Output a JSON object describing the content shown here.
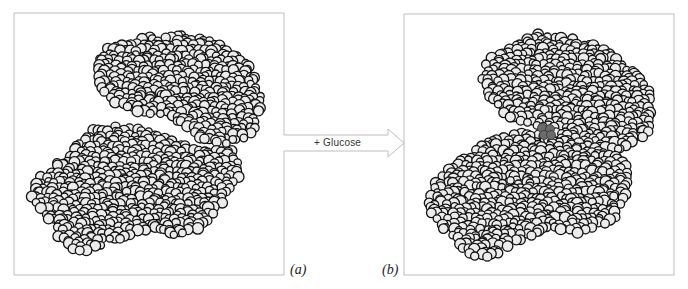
{
  "figure": {
    "arrow_label": "+ Glucose",
    "panels": [
      {
        "id": "a",
        "label": "(a)",
        "frame": {
          "x": 14,
          "y": 13,
          "w": 270,
          "h": 262
        },
        "state": "without glucose (open cleft)",
        "lobes": [
          {
            "name": "upper-lobe",
            "poly": [
              [
                100,
                50
              ],
              [
                140,
                38
              ],
              [
                180,
                34
              ],
              [
                215,
                42
              ],
              [
                240,
                55
              ],
              [
                256,
                75
              ],
              [
                262,
                100
              ],
              [
                258,
                125
              ],
              [
                245,
                140
              ],
              [
                225,
                145
              ],
              [
                200,
                140
              ],
              [
                185,
                128
              ],
              [
                160,
                115
              ],
              [
                130,
                112
              ],
              [
                108,
                100
              ],
              [
                98,
                80
              ]
            ]
          },
          {
            "name": "lower-lobe",
            "poly": [
              [
                30,
                200
              ],
              [
                38,
                178
              ],
              [
                60,
                160
              ],
              [
                95,
                128
              ],
              [
                125,
                125
              ],
              [
                150,
                130
              ],
              [
                170,
                140
              ],
              [
                200,
                150
              ],
              [
                235,
                150
              ],
              [
                240,
                175
              ],
              [
                225,
                200
              ],
              [
                200,
                230
              ],
              [
                175,
                235
              ],
              [
                140,
                230
              ],
              [
                110,
                245
              ],
              [
                75,
                255
              ],
              [
                60,
                240
              ],
              [
                50,
                222
              ]
            ]
          }
        ],
        "ligand": null
      },
      {
        "id": "b",
        "label": "(b)",
        "frame": {
          "x": 404,
          "y": 14,
          "w": 270,
          "h": 261
        },
        "state": "with glucose bound (closed cleft)",
        "lobes": [
          {
            "name": "upper-lobe",
            "poly": [
              [
                485,
                60
              ],
              [
                540,
                33
              ],
              [
                590,
                40
              ],
              [
                635,
                70
              ],
              [
                655,
                100
              ],
              [
                648,
                135
              ],
              [
                625,
                150
              ],
              [
                590,
                150
              ],
              [
                560,
                140
              ],
              [
                535,
                128
              ],
              [
                510,
                118
              ],
              [
                488,
                100
              ],
              [
                482,
                80
              ]
            ]
          },
          {
            "name": "lower-lobe",
            "poly": [
              [
                425,
                200
              ],
              [
                445,
                168
              ],
              [
                490,
                140
              ],
              [
                530,
                130
              ],
              [
                560,
                140
              ],
              [
                600,
                150
              ],
              [
                625,
                160
              ],
              [
                630,
                190
              ],
              [
                615,
                220
              ],
              [
                590,
                235
              ],
              [
                555,
                230
              ],
              [
                520,
                240
              ],
              [
                490,
                258
              ],
              [
                465,
                255
              ],
              [
                450,
                235
              ],
              [
                432,
                220
              ]
            ]
          }
        ],
        "ligand": {
          "name": "glucose",
          "cx": 546,
          "cy": 131,
          "r": 9,
          "color": "#6b6b6b"
        }
      }
    ],
    "colors": {
      "frame": "#bdbdbd",
      "atom_fill": "#ececec",
      "atom_stroke": "#111111",
      "arrow": "#bdbdbd"
    }
  }
}
